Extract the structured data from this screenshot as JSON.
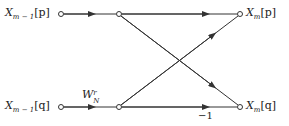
{
  "diagram": {
    "type": "butterfly-flow-graph",
    "inputs": [
      {
        "id": "in_p",
        "sym": "X",
        "sub": "m − 1",
        "idx": "[p]"
      },
      {
        "id": "in_q",
        "sym": "X",
        "sub": "m − 1",
        "idx": "[q]"
      }
    ],
    "outputs": [
      {
        "id": "out_p",
        "sym": "X",
        "sub": "m",
        "idx": "[p]"
      },
      {
        "id": "out_q",
        "sym": "X",
        "sub": "m",
        "idx": "[q]"
      }
    ],
    "twiddle": {
      "sym": "W",
      "sub": "N",
      "sup": "r"
    },
    "negation_label": "−1",
    "colors": {
      "line": "#333333",
      "text": "#222222",
      "background": "#ffffff"
    }
  }
}
